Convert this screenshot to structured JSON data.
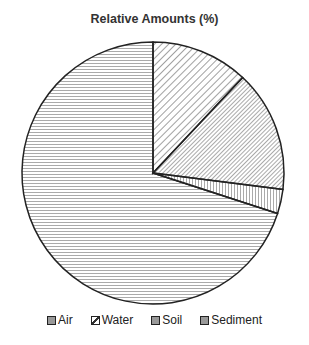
{
  "chart_data": {
    "type": "pie",
    "title": "Relative Amounts (%)",
    "categories": [
      "Air",
      "Water",
      "Soil",
      "Sediment"
    ],
    "values": [
      12,
      15,
      3,
      70
    ],
    "start_angle_deg": 0,
    "direction": "clockwise",
    "legend_position": "bottom",
    "patterns": [
      "diagonal-wide",
      "diagonal-dense",
      "vertical-lines",
      "horizontal-lines"
    ]
  },
  "legend": {
    "items": [
      {
        "label": "Air"
      },
      {
        "label": "Water"
      },
      {
        "label": "Soil"
      },
      {
        "label": "Sediment"
      }
    ]
  }
}
